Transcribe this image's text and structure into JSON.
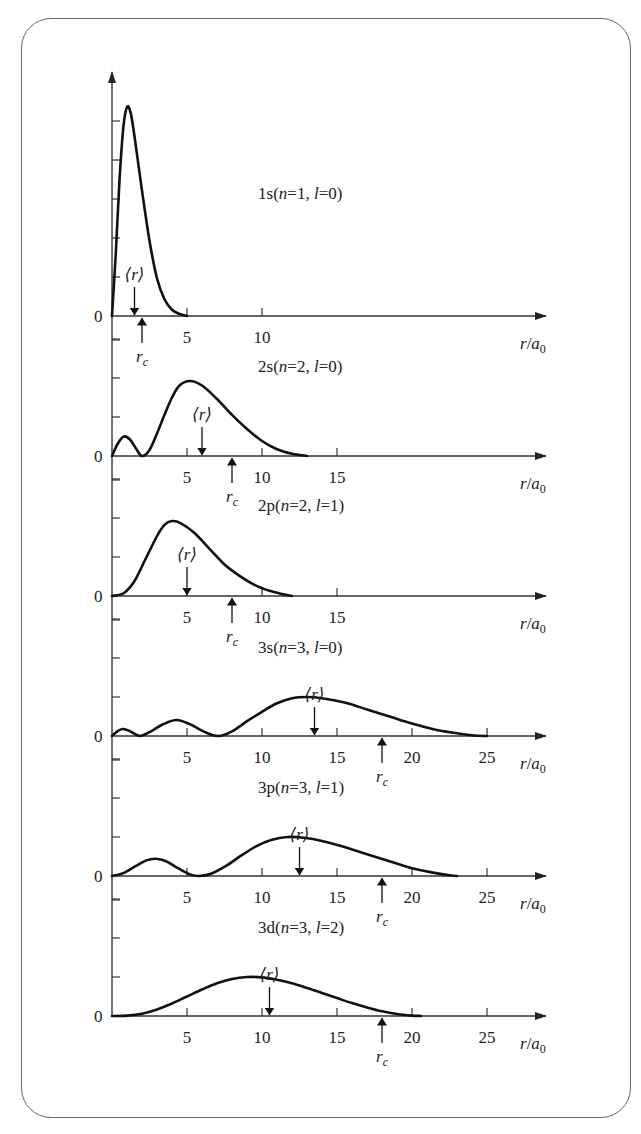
{
  "chart_data": {
    "type": "line",
    "xlabel": "r/a0",
    "xlabel_parts": {
      "var": "r",
      "sep": "/",
      "base": "a",
      "sub": "0"
    },
    "ylabel": "",
    "y_zero_label": "0",
    "mean_label": "⟨r⟩",
    "classical_label": {
      "var": "r",
      "sub": "c"
    },
    "grid": false,
    "panels": [
      {
        "id": "1s",
        "label": "1s",
        "n": 1,
        "l": 0,
        "label_text": {
          "orb": "1s",
          "n": "n",
          "neq": "=1, ",
          "l": "l",
          "leq": "=0"
        },
        "xlim": [
          0,
          28
        ],
        "x_ticks": [
          5,
          10
        ],
        "x_tick_labels": [
          "5",
          "10"
        ],
        "y_ticks_count": 5,
        "mean_r": 1.5,
        "r_c": 2.0,
        "points": [
          [
            0,
            0
          ],
          [
            0.25,
            0.3
          ],
          [
            0.5,
            0.65
          ],
          [
            0.75,
            0.9
          ],
          [
            1.0,
            1.0
          ],
          [
            1.25,
            0.97
          ],
          [
            1.5,
            0.86
          ],
          [
            2.0,
            0.6
          ],
          [
            2.5,
            0.36
          ],
          [
            3.0,
            0.18
          ],
          [
            3.5,
            0.08
          ],
          [
            4.0,
            0.03
          ],
          [
            4.5,
            0.01
          ],
          [
            5.0,
            0
          ]
        ],
        "peak_px": 209
      },
      {
        "id": "2s",
        "label": "2s",
        "n": 2,
        "l": 0,
        "label_text": {
          "orb": "2s",
          "n": "n",
          "neq": "=2, ",
          "l": "l",
          "leq": "=0"
        },
        "xlim": [
          0,
          28
        ],
        "x_ticks": [
          5,
          10,
          15
        ],
        "x_tick_labels": [
          "5",
          "10",
          "15"
        ],
        "y_ticks_count": 3,
        "mean_r": 6.0,
        "r_c": 8.0,
        "points": [
          [
            0,
            0
          ],
          [
            0.4,
            0.17
          ],
          [
            0.8,
            0.26
          ],
          [
            1.2,
            0.22
          ],
          [
            1.6,
            0.1
          ],
          [
            2.0,
            0
          ],
          [
            2.5,
            0.08
          ],
          [
            3.0,
            0.3
          ],
          [
            3.5,
            0.55
          ],
          [
            4.0,
            0.78
          ],
          [
            4.5,
            0.94
          ],
          [
            5.2,
            1.0
          ],
          [
            6.0,
            0.94
          ],
          [
            7.0,
            0.76
          ],
          [
            8.0,
            0.55
          ],
          [
            9.0,
            0.36
          ],
          [
            10.0,
            0.2
          ],
          [
            11.0,
            0.09
          ],
          [
            12.0,
            0.03
          ],
          [
            13.0,
            0
          ]
        ],
        "peak_px": 75
      },
      {
        "id": "2p",
        "label": "2p",
        "n": 2,
        "l": 1,
        "label_text": {
          "orb": "2p",
          "n": "n",
          "neq": "=2, ",
          "l": "l",
          "leq": "=1"
        },
        "xlim": [
          0,
          28
        ],
        "x_ticks": [
          5,
          10,
          15
        ],
        "x_tick_labels": [
          "5",
          "10",
          "15"
        ],
        "y_ticks_count": 3,
        "mean_r": 5.0,
        "r_c": 8.0,
        "points": [
          [
            0,
            0
          ],
          [
            0.8,
            0.04
          ],
          [
            1.5,
            0.2
          ],
          [
            2.2,
            0.48
          ],
          [
            3.0,
            0.8
          ],
          [
            3.5,
            0.95
          ],
          [
            4.0,
            1.0
          ],
          [
            4.6,
            0.97
          ],
          [
            5.5,
            0.84
          ],
          [
            6.5,
            0.63
          ],
          [
            7.5,
            0.42
          ],
          [
            8.5,
            0.27
          ],
          [
            9.5,
            0.15
          ],
          [
            10.5,
            0.07
          ],
          [
            11.5,
            0.02
          ],
          [
            12.0,
            0
          ]
        ],
        "peak_px": 75
      },
      {
        "id": "3s",
        "label": "3s",
        "n": 3,
        "l": 0,
        "label_text": {
          "orb": "3s",
          "n": "n",
          "neq": "=3, ",
          "l": "l",
          "leq": "=0"
        },
        "xlim": [
          0,
          28
        ],
        "x_ticks": [
          5,
          10,
          15,
          20,
          25
        ],
        "x_tick_labels": [
          "5",
          "10",
          "15",
          "20",
          "25"
        ],
        "y_ticks_count": 3,
        "mean_r": 13.5,
        "r_c": 18.0,
        "points": [
          [
            0,
            0
          ],
          [
            0.35,
            0.12
          ],
          [
            0.7,
            0.18
          ],
          [
            1.1,
            0.14
          ],
          [
            1.5,
            0.06
          ],
          [
            1.9,
            0
          ],
          [
            2.6,
            0.12
          ],
          [
            3.4,
            0.3
          ],
          [
            4.3,
            0.41
          ],
          [
            5.2,
            0.3
          ],
          [
            6.2,
            0.1
          ],
          [
            7.1,
            0
          ],
          [
            8.0,
            0.12
          ],
          [
            9.0,
            0.38
          ],
          [
            10.0,
            0.62
          ],
          [
            11.0,
            0.84
          ],
          [
            12.0,
            0.97
          ],
          [
            13.0,
            1.0
          ],
          [
            14.0,
            0.97
          ],
          [
            15.5,
            0.86
          ],
          [
            17.0,
            0.68
          ],
          [
            18.5,
            0.5
          ],
          [
            20.0,
            0.32
          ],
          [
            21.5,
            0.17
          ],
          [
            23.0,
            0.07
          ],
          [
            24.0,
            0.02
          ],
          [
            25.0,
            0
          ]
        ],
        "peak_px": 39
      },
      {
        "id": "3p",
        "label": "3p",
        "n": 3,
        "l": 1,
        "label_text": {
          "orb": "3p",
          "n": "n",
          "neq": "=3, ",
          "l": "l",
          "leq": "=1"
        },
        "xlim": [
          0,
          28
        ],
        "x_ticks": [
          5,
          10,
          15,
          20,
          25
        ],
        "x_tick_labels": [
          "5",
          "10",
          "15",
          "20",
          "25"
        ],
        "y_ticks_count": 3,
        "mean_r": 12.5,
        "r_c": 18.0,
        "points": [
          [
            0,
            0
          ],
          [
            0.8,
            0.08
          ],
          [
            1.6,
            0.26
          ],
          [
            2.3,
            0.4
          ],
          [
            2.9,
            0.44
          ],
          [
            3.6,
            0.38
          ],
          [
            4.4,
            0.2
          ],
          [
            5.2,
            0.04
          ],
          [
            5.8,
            0
          ],
          [
            6.6,
            0.06
          ],
          [
            7.6,
            0.26
          ],
          [
            8.6,
            0.52
          ],
          [
            9.6,
            0.76
          ],
          [
            10.6,
            0.92
          ],
          [
            11.7,
            1.0
          ],
          [
            12.8,
            0.98
          ],
          [
            14.0,
            0.9
          ],
          [
            15.5,
            0.74
          ],
          [
            17.0,
            0.56
          ],
          [
            18.5,
            0.38
          ],
          [
            20.0,
            0.2
          ],
          [
            21.5,
            0.08
          ],
          [
            22.5,
            0.02
          ],
          [
            23.0,
            0
          ]
        ],
        "peak_px": 39
      },
      {
        "id": "3d",
        "label": "3d",
        "n": 3,
        "l": 2,
        "label_text": {
          "orb": "3d",
          "n": "n",
          "neq": "=3, ",
          "l": "l",
          "leq": "=2"
        },
        "xlim": [
          0,
          28
        ],
        "x_ticks": [
          5,
          10,
          15,
          20,
          25
        ],
        "x_tick_labels": [
          "5",
          "10",
          "15",
          "20",
          "25"
        ],
        "y_ticks_count": 3,
        "mean_r": 10.5,
        "r_c": 18.0,
        "points": [
          [
            0,
            0
          ],
          [
            1.0,
            0.01
          ],
          [
            2.0,
            0.06
          ],
          [
            3.0,
            0.17
          ],
          [
            4.0,
            0.32
          ],
          [
            5.0,
            0.5
          ],
          [
            6.0,
            0.68
          ],
          [
            7.0,
            0.84
          ],
          [
            8.0,
            0.95
          ],
          [
            9.0,
            1.0
          ],
          [
            10.0,
            0.99
          ],
          [
            11.0,
            0.93
          ],
          [
            12.0,
            0.84
          ],
          [
            13.0,
            0.72
          ],
          [
            14.0,
            0.59
          ],
          [
            15.0,
            0.46
          ],
          [
            16.0,
            0.33
          ],
          [
            17.0,
            0.22
          ],
          [
            18.0,
            0.12
          ],
          [
            19.0,
            0.05
          ],
          [
            20.0,
            0.01
          ],
          [
            20.6,
            0
          ]
        ],
        "peak_px": 39
      }
    ]
  },
  "layout_px": {
    "x0": 112,
    "px_per_unit": 15,
    "axis_end_x": 546,
    "baselines": [
      316,
      456,
      596,
      736,
      876,
      1016
    ],
    "tick_spacing": 39,
    "label_pos": [
      [
        258,
        199
      ],
      [
        258,
        372
      ],
      [
        258,
        511
      ],
      [
        258,
        653
      ],
      [
        258,
        793
      ],
      [
        258,
        933
      ]
    ]
  }
}
